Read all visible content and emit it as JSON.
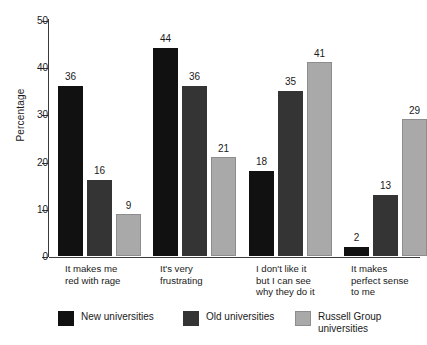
{
  "chart_data": {
    "type": "bar",
    "title": "",
    "subtitle": "",
    "xlabel": "",
    "ylabel": "Percentage",
    "ylim": [
      0,
      50
    ],
    "yticks": [
      0,
      10,
      20,
      30,
      40,
      50
    ],
    "grid": false,
    "legend_position": "bottom",
    "categories": [
      "It makes me\nred with rage",
      "It's very\nfrustrating",
      "I don't like it\nbut I can see\nwhy they do it",
      "It makes\nperfect sense\nto me"
    ],
    "series": [
      {
        "name": "New universities",
        "color": "#111111",
        "values": [
          36,
          44,
          18,
          2
        ]
      },
      {
        "name": "Old universities",
        "color": "#343434",
        "values": [
          16,
          36,
          35,
          13
        ]
      },
      {
        "name": "Russell Group\nuniversities",
        "color": "#a9a9a9",
        "values": [
          9,
          21,
          41,
          29
        ]
      }
    ]
  },
  "axis": {
    "y_title": "Percentage",
    "y_tick_labels": [
      "50",
      "40",
      "30",
      "20",
      "10",
      "0"
    ]
  },
  "legend": {
    "items": [
      {
        "label": "New universities",
        "swatch": "black-swatch"
      },
      {
        "label": "Old universities",
        "swatch": "dark-gray-swatch"
      },
      {
        "label": "Russell Group\nuniversities",
        "swatch": "light-gray-swatch"
      }
    ]
  },
  "artifact": {
    "top_strip": ""
  }
}
